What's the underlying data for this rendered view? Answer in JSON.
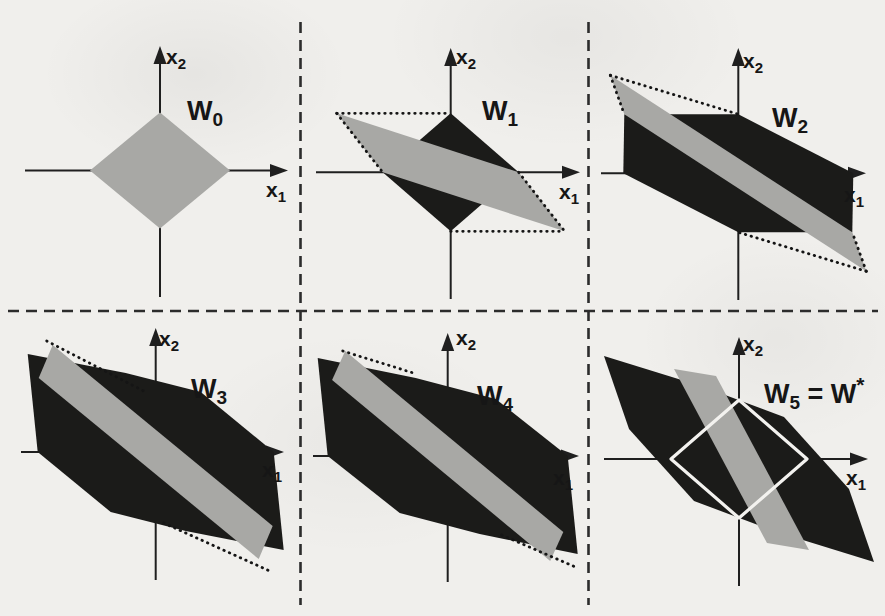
{
  "figure": {
    "colors": {
      "background": "#f0efec",
      "black_fill": "#1b1b19",
      "gray_fill": "#a8a8a5",
      "axis_ink": "#1f1f1f",
      "dotted_ink": "#151515",
      "white_outline": "#f3f2ef",
      "separator_ink": "#2c2c2c"
    }
  },
  "separators": [
    {
      "name": "separator-vertical-left",
      "from": [
        300.5,
        22
      ],
      "to": [
        300.5,
        605
      ]
    },
    {
      "name": "separator-vertical-right",
      "from": [
        588.5,
        22
      ],
      "to": [
        588.5,
        605
      ]
    },
    {
      "name": "separator-horizontal-mid",
      "from": [
        8,
        311
      ],
      "to": [
        878,
        311
      ]
    }
  ],
  "panels": [
    {
      "id": "W0",
      "label": {
        "main": "W",
        "sub": "0"
      },
      "axis_labels": {
        "x": {
          "main": "x",
          "sub": "1"
        },
        "y": {
          "main": "x",
          "sub": "2"
        }
      },
      "origin": [
        160,
        170.5
      ],
      "h_axis": [
        25,
        288
      ],
      "v_axis": [
        297,
        46
      ],
      "label_pos": [
        187,
        120
      ],
      "x_label_pos": [
        266,
        197
      ],
      "y_label_pos": [
        166,
        64
      ],
      "shapes": [
        {
          "name": "initial-set-gray-diamond",
          "fill": "gray",
          "pts": [
            [
              0,
              58
            ],
            [
              70,
              0
            ],
            [
              0,
              -58
            ],
            [
              -70,
              0
            ]
          ]
        }
      ],
      "dotted": []
    },
    {
      "id": "W1",
      "label": {
        "main": "W",
        "sub": "1"
      },
      "axis_labels": {
        "x": {
          "main": "x",
          "sub": "1"
        },
        "y": {
          "main": "x",
          "sub": "2"
        }
      },
      "origin": [
        450.7,
        172.3
      ],
      "h_axis": [
        316,
        580
      ],
      "v_axis": [
        299,
        48
      ],
      "label_pos": [
        482,
        120
      ],
      "x_label_pos": [
        559,
        199
      ],
      "y_label_pos": [
        456,
        64
      ],
      "shapes": [
        {
          "name": "black-diamond-set",
          "fill": "black",
          "pts": [
            [
              0,
              59
            ],
            [
              68,
              0
            ],
            [
              0,
              -59
            ],
            [
              -68,
              0
            ]
          ]
        },
        {
          "name": "gray-sheared-parallelogram",
          "fill": "gray",
          "pts": [
            [
              -114,
              59
            ],
            [
              68,
              0
            ],
            [
              114,
              -59
            ],
            [
              -68,
              0
            ]
          ]
        }
      ],
      "dotted": [
        [
          [
            -114,
            59
          ],
          [
            0,
            59
          ]
        ],
        [
          [
            0,
            -59
          ],
          [
            114,
            -59
          ]
        ],
        [
          [
            -114,
            59
          ],
          [
            -68,
            0
          ]
        ],
        [
          [
            68,
            0
          ],
          [
            114,
            -59
          ]
        ]
      ]
    },
    {
      "id": "W2",
      "label": {
        "main": "W",
        "sub": "2"
      },
      "axis_labels": {
        "x": {
          "main": "x",
          "sub": "1"
        },
        "y": {
          "main": "x",
          "sub": "2"
        }
      },
      "origin": [
        738.3,
        173.3
      ],
      "h_axis": [
        601,
        866
      ],
      "v_axis": [
        300,
        48
      ],
      "label_pos": [
        772,
        127
      ],
      "x_label_pos": [
        844,
        202
      ],
      "y_label_pos": [
        743,
        68
      ],
      "shapes": [
        {
          "name": "black-hexagon-set",
          "fill": "black",
          "pts": [
            [
              -114,
              59
            ],
            [
              0,
              59
            ],
            [
              115,
              0
            ],
            [
              114,
              -59
            ],
            [
              0,
              -59
            ],
            [
              -115,
              0
            ]
          ]
        },
        {
          "name": "gray-band-parallelogram",
          "fill": "gray",
          "pts": [
            [
              -128,
              98
            ],
            [
              114,
              -59
            ],
            [
              128,
              -98
            ],
            [
              -114,
              59
            ]
          ]
        }
      ],
      "dotted": [
        [
          [
            -128,
            98
          ],
          [
            0,
            59
          ]
        ],
        [
          [
            -128,
            98
          ],
          [
            -114,
            59
          ]
        ],
        [
          [
            128,
            -98
          ],
          [
            0,
            -59
          ]
        ],
        [
          [
            128,
            -98
          ],
          [
            114,
            -59
          ]
        ]
      ]
    },
    {
      "id": "W3",
      "label": {
        "main": "W",
        "sub": "3"
      },
      "axis_labels": {
        "x": {
          "main": "x",
          "sub": "1"
        },
        "y": {
          "main": "x",
          "sub": "2"
        }
      },
      "origin": [
        155.7,
        452
      ],
      "h_axis": [
        21,
        284
      ],
      "v_axis": [
        580,
        328
      ],
      "label_pos": [
        191,
        398
      ],
      "x_label_pos": [
        262,
        477
      ],
      "y_label_pos": [
        159,
        346
      ],
      "shapes": [
        {
          "name": "black-octagon-set",
          "fill": "black",
          "pts": [
            [
              -128,
              98
            ],
            [
              -30,
              79
            ],
            [
              45,
              60
            ],
            [
              118,
              0
            ],
            [
              128,
              -98
            ],
            [
              30,
              -79
            ],
            [
              -45,
              -60
            ],
            [
              -118,
              0
            ]
          ]
        },
        {
          "name": "gray-band-parallelogram",
          "fill": "gray",
          "pts": [
            [
              -103,
              107
            ],
            [
              117,
              -74
            ],
            [
              103,
              -107
            ],
            [
              -117,
              74
            ]
          ]
        }
      ],
      "dotted": [
        [
          [
            -109,
            111
          ],
          [
            -12,
            61
          ]
        ],
        [
          [
            8,
            -71
          ],
          [
            114,
            -119
          ]
        ]
      ]
    },
    {
      "id": "W4",
      "label": {
        "main": "W",
        "sub": "4"
      },
      "axis_labels": {
        "x": {
          "main": "x",
          "sub": "1"
        },
        "y": {
          "main": "x",
          "sub": "2"
        }
      },
      "origin": [
        447.7,
        456
      ],
      "h_axis": [
        313,
        579
      ],
      "v_axis": [
        582,
        333
      ],
      "label_pos": [
        477,
        405
      ],
      "x_label_pos": [
        553,
        485
      ],
      "y_label_pos": [
        456,
        345
      ],
      "shapes": [
        {
          "name": "black-octagon-set",
          "fill": "black",
          "pts": [
            [
              -130,
              98
            ],
            [
              -32,
              78
            ],
            [
              48,
              57
            ],
            [
              120,
              0
            ],
            [
              130,
              -98
            ],
            [
              32,
              -78
            ],
            [
              -48,
              -57
            ],
            [
              -120,
              0
            ]
          ]
        },
        {
          "name": "gray-band-parallelogram",
          "fill": "gray",
          "pts": [
            [
              -102.5,
              105
            ],
            [
              115.6,
              -76
            ],
            [
              102.5,
              -105
            ],
            [
              -115.6,
              76
            ]
          ]
        }
      ],
      "dotted": [
        [
          [
            -105,
            105
          ],
          [
            -31,
            82
          ]
        ],
        [
          [
            54,
            -79
          ],
          [
            130,
            -112
          ]
        ]
      ]
    },
    {
      "id": "W5",
      "label": {
        "main": "W",
        "sub": "5",
        "eq": " = W",
        "sup": "*"
      },
      "axis_labels": {
        "x": {
          "main": "x",
          "sub": "1"
        },
        "y": {
          "main": "x",
          "sub": "2"
        }
      },
      "origin": [
        739,
        459
      ],
      "h_axis": [
        604,
        868
      ],
      "v_axis": [
        586,
        337
      ],
      "label_pos": [
        764,
        403
      ],
      "x_label_pos": [
        846,
        485
      ],
      "y_label_pos": [
        743,
        351
      ],
      "shapes": [
        {
          "name": "black-octagon-set-converged",
          "fill": "black",
          "pts": [
            [
              -135,
              103
            ],
            [
              -38,
              73
            ],
            [
              45,
              42
            ],
            [
              110,
              -30
            ],
            [
              135,
              -103
            ],
            [
              38,
              -73
            ],
            [
              -45,
              -42
            ],
            [
              -110,
              30
            ]
          ]
        },
        {
          "name": "gray-band-parallelogram",
          "fill": "gray",
          "pts": [
            [
              -65,
              90
            ],
            [
              -23,
              83
            ],
            [
              70,
              -91
            ],
            [
              28,
              -84
            ]
          ]
        },
        {
          "name": "unit-diamond-outline-white",
          "fill": "white-outline",
          "pts": [
            [
              0,
              59
            ],
            [
              68,
              0
            ],
            [
              0,
              -59
            ],
            [
              -68,
              0
            ]
          ]
        }
      ],
      "dotted": []
    }
  ]
}
